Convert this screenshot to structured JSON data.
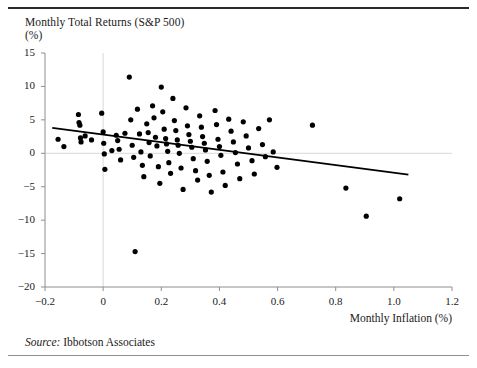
{
  "figure": {
    "title": "Monthly Total Returns (S&P 500)",
    "unit_label": "(%)",
    "xaxis_title": "Monthly Inflation (%)",
    "source_prefix": "Source:",
    "source_text": "Ibbotson Associates",
    "line_color": "#000000",
    "point_color": "#000000",
    "reference_line_color": "#d8d8d8",
    "axis_color": "#8e8e8e",
    "rule_top_color": "#2b2b2b",
    "rule_bottom_color": "#8e8e8e"
  },
  "chart_data": {
    "type": "scatter",
    "title": "Monthly Total Returns (S&P 500)",
    "xlabel": "Monthly Inflation (%)",
    "ylabel": "(%)",
    "xlim": [
      -0.2,
      1.2
    ],
    "ylim": [
      -20,
      15
    ],
    "xticks": [
      -0.2,
      0,
      0.2,
      0.4,
      0.6,
      0.8,
      1.0,
      1.2
    ],
    "xticklabels": [
      "−0.2",
      "0",
      "0.2",
      "0.4",
      "0.6",
      "0.8",
      "1.0",
      "1.2"
    ],
    "yticks": [
      15,
      10,
      5,
      0,
      -5,
      -10,
      -15,
      -20
    ],
    "yticklabels": [
      "15",
      "10",
      "5",
      "0",
      "−5",
      "−10",
      "−15",
      "−20"
    ],
    "grid": false,
    "legend": "none",
    "reference_lines": [
      {
        "axis": "x",
        "value": 0
      },
      {
        "axis": "y",
        "value": 0
      }
    ],
    "trendline": {
      "x": [
        -0.175,
        1.05
      ],
      "y": [
        3.8,
        -3.2
      ],
      "kind": "linear-fit"
    },
    "points": [
      [
        -0.155,
        2.1
      ],
      [
        -0.135,
        1.0
      ],
      [
        -0.085,
        5.8
      ],
      [
        -0.083,
        4.6
      ],
      [
        -0.08,
        4.2
      ],
      [
        -0.078,
        2.3
      ],
      [
        -0.076,
        1.7
      ],
      [
        -0.062,
        2.6
      ],
      [
        -0.04,
        2.0
      ],
      [
        -0.005,
        6.0
      ],
      [
        0.0,
        3.2
      ],
      [
        0.002,
        1.5
      ],
      [
        0.004,
        -0.1
      ],
      [
        0.006,
        -2.4
      ],
      [
        0.03,
        0.4
      ],
      [
        0.045,
        2.7
      ],
      [
        0.05,
        1.9
      ],
      [
        0.055,
        0.6
      ],
      [
        0.06,
        -1.0
      ],
      [
        0.075,
        3.0
      ],
      [
        0.09,
        11.4
      ],
      [
        0.095,
        5.0
      ],
      [
        0.1,
        1.2
      ],
      [
        0.105,
        -0.6
      ],
      [
        0.11,
        -14.7
      ],
      [
        0.118,
        6.6
      ],
      [
        0.125,
        2.9
      ],
      [
        0.13,
        0.2
      ],
      [
        0.135,
        -1.8
      ],
      [
        0.14,
        -3.5
      ],
      [
        0.15,
        4.4
      ],
      [
        0.155,
        3.1
      ],
      [
        0.158,
        1.6
      ],
      [
        0.162,
        -0.4
      ],
      [
        0.17,
        7.1
      ],
      [
        0.175,
        5.3
      ],
      [
        0.18,
        2.4
      ],
      [
        0.185,
        1.1
      ],
      [
        0.19,
        -2.0
      ],
      [
        0.195,
        -4.5
      ],
      [
        0.2,
        9.9
      ],
      [
        0.205,
        6.2
      ],
      [
        0.21,
        3.6
      ],
      [
        0.215,
        2.2
      ],
      [
        0.218,
        1.4
      ],
      [
        0.222,
        0.3
      ],
      [
        0.226,
        -1.4
      ],
      [
        0.232,
        -3.0
      ],
      [
        0.24,
        8.2
      ],
      [
        0.245,
        4.9
      ],
      [
        0.25,
        3.4
      ],
      [
        0.255,
        2.0
      ],
      [
        0.258,
        1.2
      ],
      [
        0.262,
        0.0
      ],
      [
        0.268,
        -2.2
      ],
      [
        0.275,
        -5.4
      ],
      [
        0.285,
        6.8
      ],
      [
        0.29,
        4.1
      ],
      [
        0.295,
        2.8
      ],
      [
        0.3,
        1.8
      ],
      [
        0.305,
        0.9
      ],
      [
        0.31,
        -0.8
      ],
      [
        0.318,
        -2.6
      ],
      [
        0.325,
        -4.0
      ],
      [
        0.332,
        5.6
      ],
      [
        0.338,
        3.9
      ],
      [
        0.342,
        2.5
      ],
      [
        0.348,
        1.5
      ],
      [
        0.352,
        0.5
      ],
      [
        0.358,
        -1.2
      ],
      [
        0.365,
        -3.3
      ],
      [
        0.372,
        -5.8
      ],
      [
        0.385,
        6.4
      ],
      [
        0.39,
        4.3
      ],
      [
        0.395,
        2.1
      ],
      [
        0.4,
        1.0
      ],
      [
        0.405,
        -0.3
      ],
      [
        0.412,
        -2.8
      ],
      [
        0.42,
        -4.8
      ],
      [
        0.432,
        5.1
      ],
      [
        0.44,
        3.3
      ],
      [
        0.448,
        1.7
      ],
      [
        0.455,
        0.1
      ],
      [
        0.462,
        -1.6
      ],
      [
        0.47,
        -3.8
      ],
      [
        0.482,
        4.7
      ],
      [
        0.492,
        2.6
      ],
      [
        0.5,
        0.8
      ],
      [
        0.512,
        -1.1
      ],
      [
        0.52,
        -3.1
      ],
      [
        0.535,
        3.7
      ],
      [
        0.548,
        1.3
      ],
      [
        0.558,
        -0.5
      ],
      [
        0.572,
        5.0
      ],
      [
        0.585,
        0.2
      ],
      [
        0.598,
        -2.1
      ],
      [
        0.72,
        4.2
      ],
      [
        0.835,
        -5.2
      ],
      [
        0.905,
        -9.4
      ],
      [
        1.02,
        -6.8
      ]
    ]
  }
}
